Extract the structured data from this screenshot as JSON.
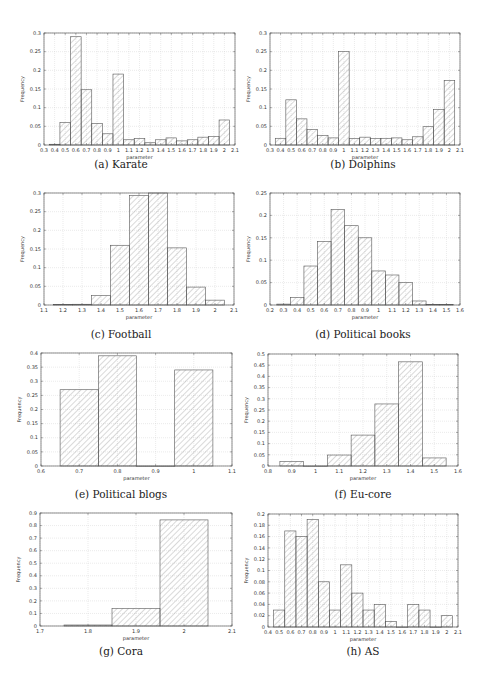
{
  "chart_data": [
    {
      "id": "karate",
      "type": "bar",
      "caption": "(a) Karate",
      "xlabel": "parameter",
      "ylabel": "frequency",
      "xlim": [
        0.3,
        2.1
      ],
      "ylim": [
        0,
        0.3
      ],
      "xticks": [
        "0.3",
        "0.4",
        "0.5",
        "0.6",
        "0.7",
        "0.8",
        "0.9",
        "1",
        "1.1",
        "1.2",
        "1.3",
        "1.4",
        "1.5",
        "1.6",
        "1.7",
        "1.8",
        "1.9",
        "2",
        "2.1"
      ],
      "yticks": [
        "0",
        "0.05",
        "0.1",
        "0.15",
        "0.2",
        "0.25",
        "0.3"
      ],
      "bin_width": 0.1,
      "categories": [
        0.4,
        0.5,
        0.6,
        0.7,
        0.8,
        0.9,
        1.0,
        1.1,
        1.2,
        1.3,
        1.4,
        1.5,
        1.6,
        1.7,
        1.8,
        1.9,
        2.0
      ],
      "values": [
        0.002,
        0.06,
        0.29,
        0.148,
        0.058,
        0.03,
        0.19,
        0.014,
        0.017,
        0.006,
        0.014,
        0.019,
        0.011,
        0.014,
        0.021,
        0.023,
        0.067
      ],
      "grid": true
    },
    {
      "id": "dolphins",
      "type": "bar",
      "caption": "(b) Dolphins",
      "xlabel": "parameter",
      "ylabel": "frequency",
      "xlim": [
        0.3,
        2.1
      ],
      "ylim": [
        0,
        0.3
      ],
      "xticks": [
        "0.3",
        "0.4",
        "0.5",
        "0.6",
        "0.7",
        "0.8",
        "0.9",
        "1",
        "1.1",
        "1.2",
        "1.3",
        "1.4",
        "1.5",
        "1.6",
        "1.7",
        "1.8",
        "1.9",
        "2",
        "2.1"
      ],
      "yticks": [
        "0",
        "0.05",
        "0.1",
        "0.15",
        "0.2",
        "0.25",
        "0.3"
      ],
      "bin_width": 0.1,
      "categories": [
        0.4,
        0.5,
        0.6,
        0.7,
        0.8,
        0.9,
        1.0,
        1.1,
        1.2,
        1.3,
        1.4,
        1.5,
        1.6,
        1.7,
        1.8,
        1.9,
        2.0
      ],
      "values": [
        0.018,
        0.121,
        0.07,
        0.042,
        0.026,
        0.019,
        0.25,
        0.017,
        0.021,
        0.017,
        0.018,
        0.019,
        0.014,
        0.022,
        0.049,
        0.095,
        0.173
      ],
      "grid": true
    },
    {
      "id": "football",
      "type": "bar",
      "caption": "(c) Football",
      "xlabel": "parameter",
      "ylabel": "frequency",
      "xlim": [
        1.1,
        2.1
      ],
      "ylim": [
        0,
        0.3
      ],
      "xticks": [
        "1.1",
        "1.2",
        "1.3",
        "1.4",
        "1.5",
        "1.6",
        "1.7",
        "1.8",
        "1.9",
        "2",
        "2.1"
      ],
      "yticks": [
        "0",
        "0.05",
        "0.1",
        "0.15",
        "0.2",
        "0.25",
        "0.3"
      ],
      "bin_width": 0.1,
      "categories": [
        1.2,
        1.3,
        1.4,
        1.5,
        1.6,
        1.7,
        1.8,
        1.9,
        2.0
      ],
      "values": [
        0.001,
        0.002,
        0.025,
        0.16,
        0.293,
        0.3,
        0.153,
        0.048,
        0.013
      ],
      "grid": true
    },
    {
      "id": "political-books",
      "type": "bar",
      "caption": "(d) Political books",
      "xlabel": "parameter",
      "ylabel": "frequency",
      "xlim": [
        0.2,
        1.6
      ],
      "ylim": [
        0,
        0.25
      ],
      "xticks": [
        "0.2",
        "0.3",
        "0.4",
        "0.5",
        "0.6",
        "0.7",
        "0.8",
        "0.9",
        "1",
        "1.1",
        "1.2",
        "1.3",
        "1.4",
        "1.5",
        "1.6"
      ],
      "yticks": [
        "0",
        "0.05",
        "0.1",
        "0.15",
        "0.2",
        "0.25"
      ],
      "bin_width": 0.1,
      "categories": [
        0.3,
        0.4,
        0.5,
        0.6,
        0.7,
        0.8,
        0.9,
        1.0,
        1.1,
        1.2,
        1.3,
        1.4,
        1.5
      ],
      "values": [
        0.002,
        0.017,
        0.087,
        0.142,
        0.213,
        0.177,
        0.15,
        0.076,
        0.067,
        0.05,
        0.009,
        0.001,
        0.001
      ],
      "grid": true
    },
    {
      "id": "political-blogs",
      "type": "bar",
      "caption": "(e) Political blogs",
      "xlabel": "parameter",
      "ylabel": "frequency",
      "xlim": [
        0.6,
        1.1
      ],
      "ylim": [
        0,
        0.4
      ],
      "xticks": [
        "0.6",
        "0.7",
        "0.8",
        "0.9",
        "1",
        "1.1"
      ],
      "yticks": [
        "0",
        "0.05",
        "0.1",
        "0.15",
        "0.2",
        "0.25",
        "0.3",
        "0.35",
        "0.4"
      ],
      "bin_width": 0.1,
      "categories": [
        0.7,
        0.8,
        0.9,
        1.0
      ],
      "values": [
        0.27,
        0.39,
        0.0,
        0.34
      ],
      "grid": true
    },
    {
      "id": "eu-core",
      "type": "bar",
      "caption": "(f) Eu-core",
      "xlabel": "parameter",
      "ylabel": "frequency",
      "xlim": [
        0.8,
        1.6
      ],
      "ylim": [
        0,
        0.5
      ],
      "xticks": [
        "0.8",
        "0.9",
        "1",
        "1.1",
        "1.2",
        "1.3",
        "1.4",
        "1.5",
        "1.6"
      ],
      "yticks": [
        "0",
        "0.05",
        "0.1",
        "0.15",
        "0.2",
        "0.25",
        "0.3",
        "0.35",
        "0.4",
        "0.45",
        "0.5"
      ],
      "bin_width": 0.1,
      "categories": [
        0.9,
        1.0,
        1.1,
        1.2,
        1.3,
        1.4,
        1.5
      ],
      "values": [
        0.02,
        0.0,
        0.049,
        0.138,
        0.277,
        0.465,
        0.036
      ],
      "grid": true
    },
    {
      "id": "cora",
      "type": "bar",
      "caption": "(g) Cora",
      "xlabel": "parameter",
      "ylabel": "frequency",
      "xlim": [
        1.7,
        2.1
      ],
      "ylim": [
        0,
        0.9
      ],
      "xticks": [
        "1.7",
        "1.8",
        "1.9",
        "2",
        "2.1"
      ],
      "yticks": [
        "0",
        "0.1",
        "0.2",
        "0.3",
        "0.4",
        "0.5",
        "0.6",
        "0.7",
        "0.8",
        "0.9"
      ],
      "bin_width": 0.1,
      "categories": [
        1.8,
        1.9,
        2.0
      ],
      "values": [
        0.008,
        0.14,
        0.845
      ],
      "grid": true
    },
    {
      "id": "as",
      "type": "bar",
      "caption": "(h) AS",
      "xlabel": "parameter",
      "ylabel": "frequency",
      "xlim": [
        0.4,
        2.1
      ],
      "ylim": [
        0,
        0.2
      ],
      "xticks": [
        "0.4",
        "0.5",
        "0.6",
        "0.7",
        "0.8",
        "0.9",
        "1",
        "1.1",
        "1.2",
        "1.3",
        "1.4",
        "1.5",
        "1.6",
        "1.7",
        "1.8",
        "1.9",
        "2",
        "2.1"
      ],
      "yticks": [
        "0",
        "0.02",
        "0.04",
        "0.06",
        "0.08",
        "0.1",
        "0.12",
        "0.14",
        "0.16",
        "0.18",
        "0.2"
      ],
      "bin_width": 0.1,
      "categories": [
        0.5,
        0.6,
        0.7,
        0.8,
        0.9,
        1.0,
        1.1,
        1.2,
        1.3,
        1.4,
        1.5,
        1.6,
        1.7,
        1.8,
        1.9,
        2.0
      ],
      "values": [
        0.03,
        0.17,
        0.16,
        0.19,
        0.08,
        0.03,
        0.11,
        0.06,
        0.03,
        0.04,
        0.01,
        0.0,
        0.04,
        0.03,
        0.0,
        0.02
      ],
      "grid": true
    }
  ],
  "layout": {
    "panels": [
      {
        "left": 0,
        "top": 0,
        "plot": {
          "x": 44,
          "y": 33,
          "w": 191,
          "h": 112
        },
        "caption_top": 158
      },
      {
        "left": 242,
        "top": 0,
        "plot": {
          "x": 28,
          "y": 33,
          "w": 190,
          "h": 112
        },
        "caption_top": 158
      },
      {
        "left": 0,
        "top": 170,
        "plot": {
          "x": 44,
          "y": 23,
          "w": 190,
          "h": 112
        },
        "caption_top": 158
      },
      {
        "left": 242,
        "top": 170,
        "plot": {
          "x": 28,
          "y": 23,
          "w": 190,
          "h": 112
        },
        "caption_top": 158
      },
      {
        "left": 0,
        "top": 340,
        "plot": {
          "x": 41,
          "y": 13,
          "w": 191,
          "h": 113
        },
        "caption_top": 148
      },
      {
        "left": 242,
        "top": 340,
        "plot": {
          "x": 26,
          "y": 14,
          "w": 190,
          "h": 112
        },
        "caption_top": 148
      },
      {
        "left": 0,
        "top": 510,
        "plot": {
          "x": 40,
          "y": 3,
          "w": 192,
          "h": 113
        },
        "caption_top": 135
      },
      {
        "left": 242,
        "top": 510,
        "plot": {
          "x": 26,
          "y": 4,
          "w": 190,
          "h": 113
        },
        "caption_top": 135
      }
    ]
  }
}
